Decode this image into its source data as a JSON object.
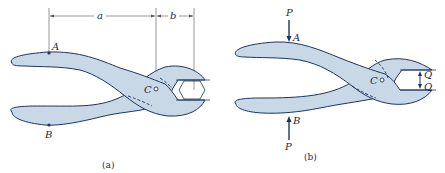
{
  "figure_a": {
    "caption": "(a)",
    "labels": {
      "A": "A",
      "B": "B",
      "C": "C"
    },
    "dimensions": {
      "a": "a",
      "b": "b"
    },
    "object": "pliers gripping hex nut"
  },
  "figure_b": {
    "caption": "(b)",
    "labels": {
      "A": "A",
      "B": "B",
      "C": "C"
    },
    "forces": {
      "P_top": "P",
      "P_bottom": "P",
      "Q_top": "Q",
      "Q_bottom": "Q"
    },
    "object": "pliers free-body diagram"
  },
  "colors": {
    "fill": "#c9d8e6",
    "stroke": "#1e3560",
    "text": "#1e2a4a"
  }
}
